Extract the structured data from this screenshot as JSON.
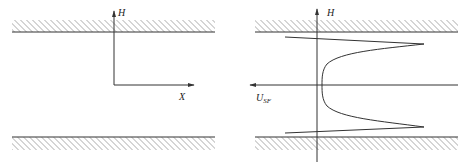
{
  "figure": {
    "left_panel": {
      "vertical_axis_label": "H",
      "horizontal_axis_label": "X"
    },
    "right_panel": {
      "vertical_axis_label": "H",
      "velocity_label_main": "U",
      "velocity_label_sub": "SF"
    },
    "colors": {
      "line": "#333333",
      "hatch": "#555555",
      "background": "#ffffff"
    }
  }
}
